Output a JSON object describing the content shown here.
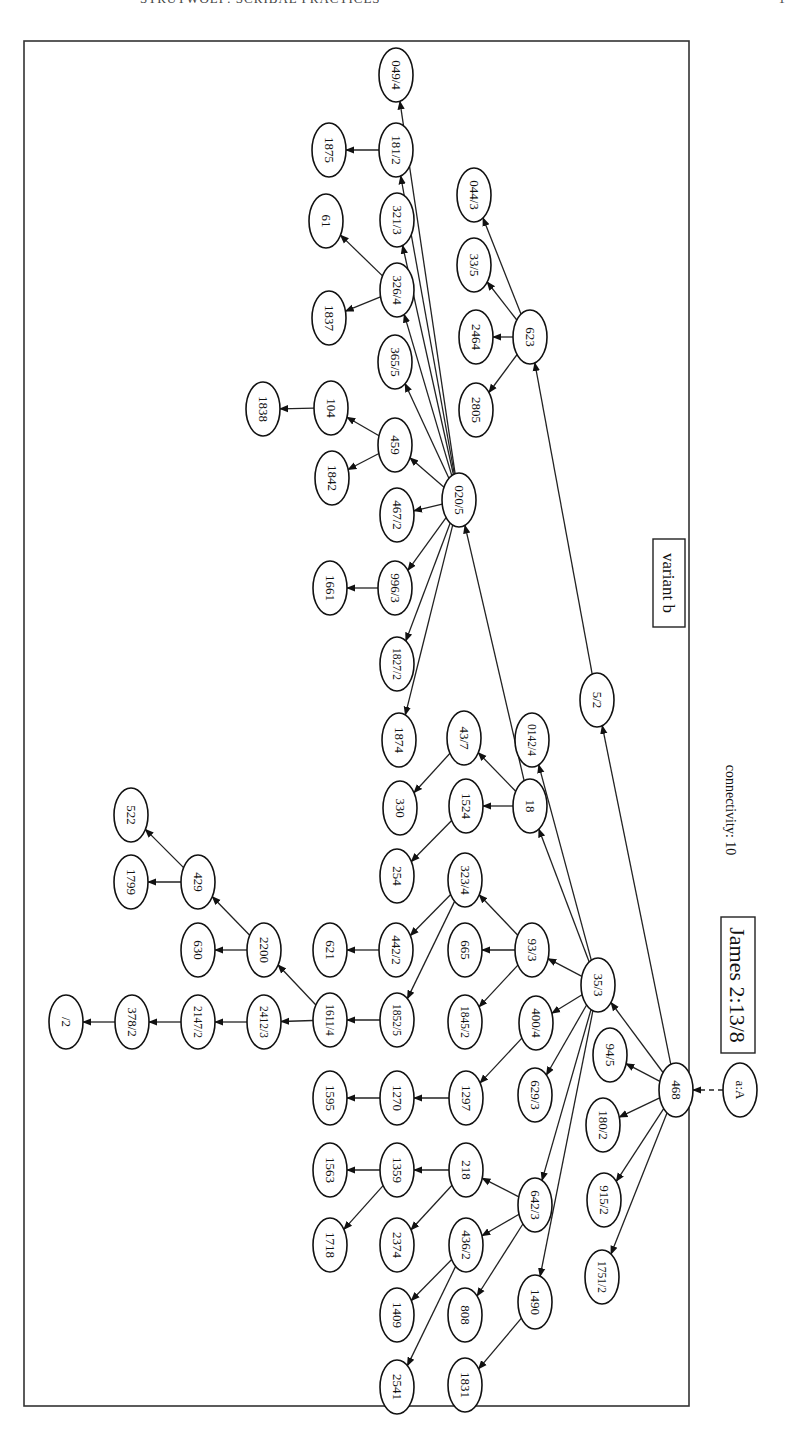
{
  "header": {
    "running_title": "STRUTWOLF: SCRIBAL PRACTICES",
    "page_number": "1"
  },
  "diagram": {
    "title": "James 2:13/8",
    "connectivity_label": "connectivity: 10",
    "variant_label": "variant b",
    "orientation": "rotated 90° clockwise",
    "nodes": [
      {
        "id": "a:A",
        "x": 740,
        "y": 1090
      },
      {
        "id": "468",
        "x": 676,
        "y": 1090
      },
      {
        "id": "94/5",
        "x": 610,
        "y": 1055
      },
      {
        "id": "180/2",
        "x": 603,
        "y": 1125
      },
      {
        "id": "915/2",
        "x": 604,
        "y": 1200
      },
      {
        "id": "1751/2",
        "x": 602,
        "y": 1277
      },
      {
        "id": "35/3",
        "x": 598,
        "y": 985
      },
      {
        "id": "5/2",
        "x": 597,
        "y": 700
      },
      {
        "id": "623",
        "x": 530,
        "y": 337
      },
      {
        "id": "044/3",
        "x": 474,
        "y": 195
      },
      {
        "id": "33/5",
        "x": 474,
        "y": 265
      },
      {
        "id": "2464",
        "x": 476,
        "y": 337
      },
      {
        "id": "2805",
        "x": 476,
        "y": 410
      },
      {
        "id": "020/5",
        "x": 459,
        "y": 500
      },
      {
        "id": "049/4",
        "x": 396,
        "y": 75
      },
      {
        "id": "181/2",
        "x": 396,
        "y": 150
      },
      {
        "id": "1875",
        "x": 329,
        "y": 150
      },
      {
        "id": "321/3",
        "x": 397,
        "y": 220
      },
      {
        "id": "61",
        "x": 326,
        "y": 221
      },
      {
        "id": "326/4",
        "x": 397,
        "y": 290
      },
      {
        "id": "1837",
        "x": 329,
        "y": 318
      },
      {
        "id": "365/5",
        "x": 395,
        "y": 362
      },
      {
        "id": "104",
        "x": 331,
        "y": 408
      },
      {
        "id": "1838",
        "x": 263,
        "y": 409
      },
      {
        "id": "459",
        "x": 395,
        "y": 445
      },
      {
        "id": "1842",
        "x": 332,
        "y": 478
      },
      {
        "id": "467/2",
        "x": 397,
        "y": 515
      },
      {
        "id": "996/3",
        "x": 395,
        "y": 588
      },
      {
        "id": "1661",
        "x": 330,
        "y": 588
      },
      {
        "id": "1827/2",
        "x": 397,
        "y": 664
      },
      {
        "id": "1874",
        "x": 399,
        "y": 740
      },
      {
        "id": "0142/4",
        "x": 532,
        "y": 740
      },
      {
        "id": "43/7",
        "x": 464,
        "y": 738
      },
      {
        "id": "18",
        "x": 530,
        "y": 806
      },
      {
        "id": "330",
        "x": 400,
        "y": 808
      },
      {
        "id": "1524",
        "x": 466,
        "y": 806
      },
      {
        "id": "254",
        "x": 397,
        "y": 876
      },
      {
        "id": "323/4",
        "x": 465,
        "y": 880
      },
      {
        "id": "93/3",
        "x": 532,
        "y": 950
      },
      {
        "id": "665",
        "x": 465,
        "y": 950
      },
      {
        "id": "1845/2",
        "x": 465,
        "y": 1022
      },
      {
        "id": "442/2",
        "x": 396,
        "y": 950
      },
      {
        "id": "621",
        "x": 330,
        "y": 950
      },
      {
        "id": "1852/5",
        "x": 397,
        "y": 1020
      },
      {
        "id": "1611/4",
        "x": 330,
        "y": 1020
      },
      {
        "id": "2200",
        "x": 264,
        "y": 950
      },
      {
        "id": "630",
        "x": 198,
        "y": 950
      },
      {
        "id": "429",
        "x": 198,
        "y": 882
      },
      {
        "id": "522",
        "x": 131,
        "y": 815
      },
      {
        "id": "1799",
        "x": 131,
        "y": 882
      },
      {
        "id": "2412/3",
        "x": 264,
        "y": 1022
      },
      {
        "id": "2147/2",
        "x": 198,
        "y": 1022
      },
      {
        "id": "378/2",
        "x": 132,
        "y": 1022
      },
      {
        "id": "/2",
        "x": 66,
        "y": 1022
      },
      {
        "id": "400/4",
        "x": 536,
        "y": 1023
      },
      {
        "id": "629/3",
        "x": 535,
        "y": 1095
      },
      {
        "id": "1297",
        "x": 466,
        "y": 1098
      },
      {
        "id": "1270",
        "x": 397,
        "y": 1098
      },
      {
        "id": "1595",
        "x": 330,
        "y": 1098
      },
      {
        "id": "642/3",
        "x": 535,
        "y": 1205
      },
      {
        "id": "218",
        "x": 466,
        "y": 1170
      },
      {
        "id": "1359",
        "x": 397,
        "y": 1170
      },
      {
        "id": "1563",
        "x": 330,
        "y": 1170
      },
      {
        "id": "2374",
        "x": 397,
        "y": 1245
      },
      {
        "id": "1718",
        "x": 330,
        "y": 1245
      },
      {
        "id": "436/2",
        "x": 466,
        "y": 1245
      },
      {
        "id": "808",
        "x": 465,
        "y": 1315
      },
      {
        "id": "1409",
        "x": 397,
        "y": 1315
      },
      {
        "id": "2541",
        "x": 397,
        "y": 1387
      },
      {
        "id": "1490",
        "x": 535,
        "y": 1302
      },
      {
        "id": "1831",
        "x": 465,
        "y": 1385
      }
    ],
    "edges": [
      {
        "from": "a:A",
        "to": "468",
        "style": "dashed"
      },
      {
        "from": "468",
        "to": "94/5"
      },
      {
        "from": "468",
        "to": "180/2"
      },
      {
        "from": "468",
        "to": "915/2"
      },
      {
        "from": "468",
        "to": "1751/2"
      },
      {
        "from": "468",
        "to": "35/3"
      },
      {
        "from": "468",
        "to": "5/2"
      },
      {
        "from": "5/2",
        "to": "623"
      },
      {
        "from": "623",
        "to": "044/3"
      },
      {
        "from": "623",
        "to": "33/5"
      },
      {
        "from": "623",
        "to": "2464"
      },
      {
        "from": "623",
        "to": "2805"
      },
      {
        "from": "35/3",
        "to": "0142/4"
      },
      {
        "from": "35/3",
        "to": "18"
      },
      {
        "from": "35/3",
        "to": "93/3"
      },
      {
        "from": "35/3",
        "to": "400/4"
      },
      {
        "from": "35/3",
        "to": "629/3"
      },
      {
        "from": "35/3",
        "to": "642/3"
      },
      {
        "from": "35/3",
        "to": "1490"
      },
      {
        "from": "18",
        "to": "43/7"
      },
      {
        "from": "18",
        "to": "1524"
      },
      {
        "from": "18",
        "to": "020/5"
      },
      {
        "from": "43/7",
        "to": "330"
      },
      {
        "from": "1524",
        "to": "254"
      },
      {
        "from": "020/5",
        "to": "049/4"
      },
      {
        "from": "020/5",
        "to": "181/2"
      },
      {
        "from": "020/5",
        "to": "321/3"
      },
      {
        "from": "020/5",
        "to": "326/4"
      },
      {
        "from": "020/5",
        "to": "365/5"
      },
      {
        "from": "020/5",
        "to": "459"
      },
      {
        "from": "020/5",
        "to": "467/2"
      },
      {
        "from": "020/5",
        "to": "996/3"
      },
      {
        "from": "020/5",
        "to": "1827/2"
      },
      {
        "from": "020/5",
        "to": "1874"
      },
      {
        "from": "181/2",
        "to": "1875"
      },
      {
        "from": "326/4",
        "to": "61"
      },
      {
        "from": "326/4",
        "to": "1837"
      },
      {
        "from": "459",
        "to": "104"
      },
      {
        "from": "459",
        "to": "1842"
      },
      {
        "from": "104",
        "to": "1838"
      },
      {
        "from": "996/3",
        "to": "1661"
      },
      {
        "from": "93/3",
        "to": "323/4"
      },
      {
        "from": "93/3",
        "to": "665"
      },
      {
        "from": "93/3",
        "to": "1845/2"
      },
      {
        "from": "323/4",
        "to": "442/2"
      },
      {
        "from": "323/4",
        "to": "1852/5"
      },
      {
        "from": "442/2",
        "to": "621"
      },
      {
        "from": "1852/5",
        "to": "1611/4"
      },
      {
        "from": "1611/4",
        "to": "2200"
      },
      {
        "from": "1611/4",
        "to": "2412/3"
      },
      {
        "from": "2200",
        "to": "429"
      },
      {
        "from": "2200",
        "to": "630"
      },
      {
        "from": "429",
        "to": "522"
      },
      {
        "from": "429",
        "to": "1799"
      },
      {
        "from": "2412/3",
        "to": "2147/2"
      },
      {
        "from": "2147/2",
        "to": "378/2"
      },
      {
        "from": "378/2",
        "to": "/2"
      },
      {
        "from": "400/4",
        "to": "1297"
      },
      {
        "from": "1297",
        "to": "1270"
      },
      {
        "from": "1270",
        "to": "1595"
      },
      {
        "from": "642/3",
        "to": "218"
      },
      {
        "from": "642/3",
        "to": "436/2"
      },
      {
        "from": "642/3",
        "to": "808"
      },
      {
        "from": "218",
        "to": "1359"
      },
      {
        "from": "218",
        "to": "2374"
      },
      {
        "from": "1359",
        "to": "1563"
      },
      {
        "from": "1359",
        "to": "1718"
      },
      {
        "from": "436/2",
        "to": "1409"
      },
      {
        "from": "436/2",
        "to": "2541"
      },
      {
        "from": "1490",
        "to": "1831"
      }
    ]
  }
}
